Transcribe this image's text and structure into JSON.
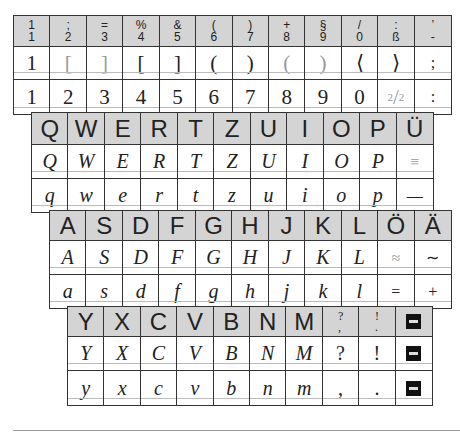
{
  "number_block": {
    "header": [
      [
        "1",
        "1"
      ],
      [
        ";",
        "2"
      ],
      [
        "=",
        "3"
      ],
      [
        "%",
        "4"
      ],
      [
        "&",
        "5"
      ],
      [
        "(",
        "6"
      ],
      [
        ")",
        "7"
      ],
      [
        "+",
        "8"
      ],
      [
        "§",
        "9"
      ],
      [
        "/",
        "0"
      ],
      [
        ":",
        "ß"
      ],
      [
        "’",
        "-"
      ]
    ],
    "shifted": [
      "1",
      "[",
      "]",
      "[",
      "]",
      "(",
      ")",
      "(",
      ")",
      "⟨",
      "⟩",
      ";"
    ],
    "plain": [
      "1",
      "2",
      "3",
      "4",
      "5",
      "6",
      "7",
      "8",
      "9",
      "0",
      "2/2",
      ":"
    ]
  },
  "q_block": {
    "header": [
      "Q",
      "W",
      "E",
      "R",
      "T",
      "Z",
      "U",
      "I",
      "O",
      "P",
      "Ü"
    ],
    "upper": [
      "Q",
      "W",
      "E",
      "R",
      "T",
      "Z",
      "U",
      "I",
      "O",
      "P",
      "≡"
    ],
    "lower": [
      "q",
      "w",
      "e",
      "r",
      "t",
      "z",
      "u",
      "i",
      "o",
      "p",
      "—"
    ]
  },
  "a_block": {
    "header": [
      "A",
      "S",
      "D",
      "F",
      "G",
      "H",
      "J",
      "K",
      "L",
      "Ö",
      "Ä"
    ],
    "upper": [
      "A",
      "S",
      "D",
      "F",
      "G",
      "H",
      "J",
      "K",
      "L",
      "≈",
      "∼"
    ],
    "lower": [
      "a",
      "s",
      "d",
      "f",
      "g",
      "h",
      "j",
      "k",
      "l",
      "=",
      "+"
    ]
  },
  "y_block": {
    "header": [
      "Y",
      "X",
      "C",
      "V",
      "B",
      "N",
      "M",
      "?\n,",
      "!\n."
    ],
    "upper": [
      "Y",
      "X",
      "C",
      "V",
      "B",
      "N",
      "M",
      "?",
      "!"
    ],
    "lower": [
      "y",
      "x",
      "c",
      "v",
      "b",
      "n",
      "m",
      ",",
      "."
    ],
    "last_key_icon": "enter-key-icon"
  },
  "fraction": {
    "num": "2",
    "den": "2"
  }
}
